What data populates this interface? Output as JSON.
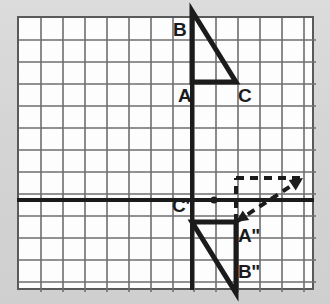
{
  "figure": {
    "background_color": "#d9d9d9",
    "panel_color": "#fdfdfd",
    "grid_line_color": "#6e6e6e",
    "axis_color": "#1b1b1b",
    "figure_color": "#1b1b1b",
    "panel_border_color": "#5a5a5a"
  },
  "grid": {
    "origin_x": 17,
    "origin_y": 16,
    "width": 297,
    "height": 274,
    "cell_size": 22,
    "columns": 14,
    "rows": 13,
    "x_lines": [
      17,
      39,
      61,
      83,
      105,
      127,
      149,
      171,
      192,
      214,
      236,
      258,
      280,
      302,
      314
    ],
    "y_lines": [
      16,
      38,
      60,
      82,
      104,
      126,
      148,
      170,
      178,
      200,
      222,
      244,
      266,
      290
    ]
  },
  "axes": {
    "vertical_axis_x": 192,
    "horizontal_axis_y": 200,
    "stroke_width": 4
  },
  "center_point": {
    "label": "center-of-rotation",
    "x": 214,
    "y": 200,
    "radius": 3.5
  },
  "triangles": [
    {
      "name": "triangle-abc",
      "stroke_width": 5,
      "vertices": [
        {
          "id": "A",
          "label": "A",
          "x": 192,
          "y": 82,
          "label_x": 178,
          "label_y": 86
        },
        {
          "id": "B",
          "label": "B",
          "x": 192,
          "y": 11,
          "label_x": 173,
          "label_y": 20
        },
        {
          "id": "C",
          "label": "C",
          "x": 236,
          "y": 82,
          "label_x": 238,
          "label_y": 86
        }
      ],
      "path": "M 192 82 L 192 11 L 236 82 Z"
    },
    {
      "name": "triangle-a2b2c2",
      "stroke_width": 5,
      "vertices": [
        {
          "id": "A2",
          "label": "A\"",
          "x": 236,
          "y": 222,
          "label_x": 238,
          "label_y": 226
        },
        {
          "id": "B2",
          "label": "B\"",
          "x": 236,
          "y": 293,
          "label_x": 238,
          "label_y": 262
        },
        {
          "id": "C2",
          "label": "C\"",
          "x": 192,
          "y": 222,
          "label_x": 172,
          "label_y": 196
        }
      ],
      "path": "M 236 222 L 236 293 L 192 222 Z"
    }
  ],
  "rotation_indicator": {
    "name": "rotation-arrow",
    "stroke_width": 4,
    "dash_pattern": "8,6",
    "vertical_segment": {
      "x": 236,
      "y1": 222,
      "y2": 178
    },
    "horizontal_segment": {
      "y": 178,
      "x1": 236,
      "x2": 303
    },
    "diagonal_arrow": {
      "x1": 236,
      "y1": 222,
      "x2": 300,
      "y2": 180
    },
    "arrowheads": [
      {
        "name": "arrowhead-upper-right",
        "x": 303,
        "y": 178,
        "angle": -34
      },
      {
        "name": "arrowhead-lower-left",
        "x": 236,
        "y": 222,
        "angle": 146
      }
    ]
  },
  "labels": [
    {
      "id": "A",
      "text": "A"
    },
    {
      "id": "B",
      "text": "B"
    },
    {
      "id": "C",
      "text": "C"
    },
    {
      "id": "A2",
      "text": "A\""
    },
    {
      "id": "B2",
      "text": "B\""
    },
    {
      "id": "C2",
      "text": "C\""
    }
  ]
}
